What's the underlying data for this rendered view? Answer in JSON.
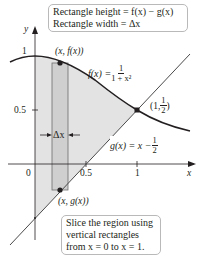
{
  "top_box": {
    "line1": "Rectangle height = f(x) − g(x)",
    "line2": "Rectangle width = Δx"
  },
  "bottom_box": {
    "line1": "Slice the region using",
    "line2": "vertical rectangles",
    "line3": "from x = 0 to x = 1."
  },
  "axes": {
    "x_label": "x",
    "y_label": "y",
    "x_ticks": [
      "0",
      "0.5",
      "1"
    ],
    "y_ticks": [
      "0.5",
      "1"
    ]
  },
  "curves": {
    "f": {
      "lhs": "f(x) = ",
      "num": "1",
      "den": "1 + x²"
    },
    "g": {
      "lhs": "g(x) = x − ",
      "num": "1",
      "den": "2"
    }
  },
  "points": {
    "top": "(x, f(x))",
    "bottom": "(x, g(x))",
    "intersection_prefix": "(1, ",
    "intersection_num": "1",
    "intersection_den": "2",
    "intersection_suffix": ")"
  },
  "delta_label": "Δx",
  "colors": {
    "region_fill": "#e3e3e3",
    "rect_fill": "#cfcfcf",
    "curve": "#231f20",
    "line": "#4a4a4a",
    "box_border": "#b9b9b9"
  }
}
